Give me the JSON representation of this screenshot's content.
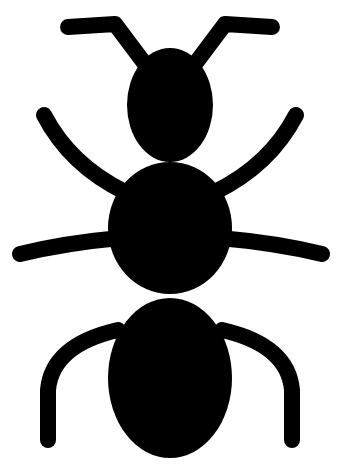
{
  "image": {
    "subject": "ant-silhouette-icon",
    "background_color": "#ffffff",
    "fill_color": "#000000"
  }
}
